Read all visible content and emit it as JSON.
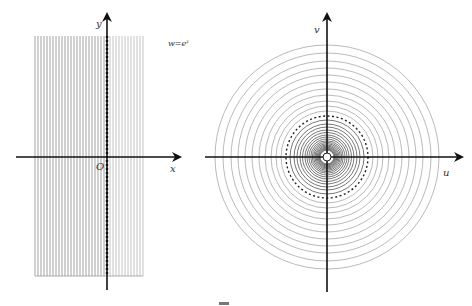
{
  "left_plot": {
    "name": "z-plane",
    "axis_x_label": "x",
    "axis_y_label": "y",
    "origin_label": "O",
    "mapping_label": "w=e",
    "mapping_exponent": "z",
    "line_x_start": 35,
    "line_x_end": 143,
    "line_count": 37,
    "line_y_top": 36,
    "line_y_bottom": 276,
    "y_axis_x": 107,
    "x_axis_y": 157,
    "left_color": "#8a8a8a",
    "right_color": "#b5b5b5"
  },
  "right_plot": {
    "name": "w-plane",
    "axis_u_label": "u",
    "axis_v_label": "v",
    "center_x": 327,
    "center_y": 157,
    "outer_radii": [
      112,
      104,
      96,
      89,
      82,
      75,
      68,
      62,
      56,
      51,
      46
    ],
    "dashed_radius": 41,
    "inner_radii": [
      37,
      33,
      30,
      27,
      24.5,
      22,
      20,
      18,
      16.3,
      14.8,
      13.4,
      12.1,
      11,
      10,
      9.1,
      8.3,
      7.6,
      7
    ],
    "outer_color": "#a8a8a8",
    "inner_color": "#555555"
  },
  "caption": {
    "glyph": "▔"
  }
}
